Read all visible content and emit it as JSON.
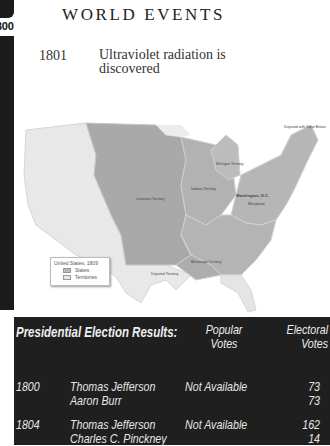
{
  "side_tab": {
    "year_label": "1800"
  },
  "header": {
    "title": "WORLD EVENTS"
  },
  "world_event": {
    "year": "1801",
    "description": "Ultraviolet radiation is discovered"
  },
  "map": {
    "labels": {
      "louisiana": "Louisiana Territory",
      "indiana": "Indiana Territory",
      "michigan": "Michigan Territory",
      "mississippi": "Mississippi Territory",
      "illinois": "Illinois Territory",
      "spanish": "Disputed Territory",
      "british": "Disputed with Great Britain",
      "washington": "Washington, D.C.",
      "maryland": "Maryland",
      "states": [
        "ME",
        "VT",
        "NH",
        "MA",
        "CT",
        "RI",
        "NY",
        "PA",
        "NJ",
        "DE",
        "OH",
        "VA",
        "KY",
        "TN",
        "NC",
        "SC",
        "GA",
        "MD"
      ]
    },
    "legend": {
      "title": "United States, 1809",
      "items": [
        "States",
        "Territories"
      ]
    },
    "colors": {
      "states": "#b9b9b9",
      "territories": "#a6a6a6",
      "other": "#e6e6e6"
    }
  },
  "election_table": {
    "title": "Presidential Election Results:",
    "columns": {
      "popular": "Popular Votes",
      "electoral": "Electoral Votes"
    },
    "rows": [
      {
        "year": "1800",
        "candidates": [
          "Thomas Jefferson",
          "Aaron Burr"
        ],
        "popular": "Not Available",
        "electoral": [
          "73",
          "73"
        ]
      },
      {
        "year": "1804",
        "candidates": [
          "Thomas Jefferson",
          "Charles C. Pinckney"
        ],
        "popular": "Not Available",
        "electoral": [
          "162",
          "14"
        ]
      }
    ]
  }
}
